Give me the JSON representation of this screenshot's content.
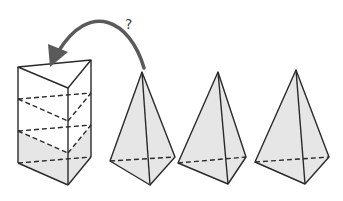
{
  "figure": {
    "question_mark": "?",
    "colors": {
      "stroke": "#2a2a2a",
      "fill": "#e6e6e6",
      "arrow": "#5a5a5a",
      "background": "#ffffff"
    },
    "shapes": [
      {
        "name": "triangular-prism",
        "layers": 3,
        "filled_layers": 1
      },
      {
        "name": "pyramid-1"
      },
      {
        "name": "pyramid-2"
      },
      {
        "name": "pyramid-3"
      }
    ]
  }
}
